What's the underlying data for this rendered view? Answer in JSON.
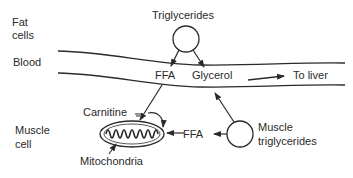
{
  "regions": {
    "fat_cells": [
      "Fat",
      "cells"
    ],
    "blood": "Blood",
    "muscle_cell": [
      "Muscle",
      "cell"
    ]
  },
  "nodes": {
    "triglycerides": "Triglycerides",
    "ffa_blood": "FFA",
    "glycerol": "Glycerol",
    "to_liver": "To liver",
    "carnitine": "Carnitine",
    "mitochondria": "Mitochondria",
    "ffa_muscle": "FFA",
    "muscle_triglycerides": [
      "Muscle",
      "triglycerides"
    ]
  },
  "colors": {
    "line": "#2a2a2a",
    "background": "#ffffff"
  }
}
